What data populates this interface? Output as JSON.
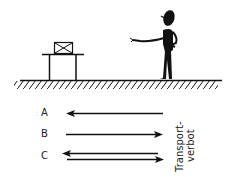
{
  "figure": {
    "colors": {
      "ink": "#111111",
      "background": "#ffffff"
    }
  },
  "options": [
    {
      "label": "A",
      "arrows": [
        "left"
      ]
    },
    {
      "label": "B",
      "arrows": [
        "right"
      ]
    },
    {
      "label": "C",
      "arrows": [
        "left",
        "right"
      ]
    }
  ],
  "side_label": {
    "line1": "Transport-",
    "line2": "verbot"
  }
}
